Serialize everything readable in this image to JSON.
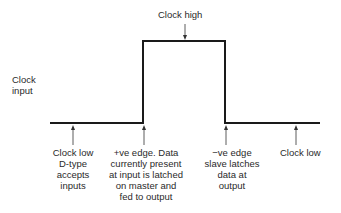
{
  "diagram": {
    "signal_label": [
      "Clock",
      "input"
    ],
    "annotations": {
      "clock_high": "Clock high",
      "clock_low_start": [
        "Clock low",
        "D-type",
        "accepts",
        "inputs"
      ],
      "positive_edge": [
        "+ve edge. Data",
        "currently present",
        "at input is latched",
        "on master and",
        "fed to output"
      ],
      "negative_edge": [
        "−ve edge",
        "slave latches",
        "data at",
        "output"
      ],
      "clock_low_end": "Clock low"
    },
    "waveform": {
      "low_y": 123,
      "high_y": 41,
      "start_x": 50,
      "rise_x": 143,
      "fall_x": 225,
      "end_x": 320,
      "color": "#1a1a1a"
    }
  }
}
